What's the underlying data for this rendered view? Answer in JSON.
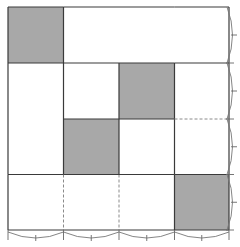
{
  "diagram": {
    "grid": {
      "rows": 4,
      "cols": 4
    },
    "colors": {
      "shaded": "#a8a8a8",
      "line": "#3a3a3a",
      "dashed": "#8a8a8a",
      "background": "#ffffff"
    },
    "shaded_cells": [
      {
        "row": 0,
        "col": 0
      },
      {
        "row": 1,
        "col": 2
      },
      {
        "row": 2,
        "col": 1
      },
      {
        "row": 3,
        "col": 3
      }
    ],
    "merged_regions": [
      {
        "row": 0,
        "col": 1,
        "rowspan": 1,
        "colspan": 3
      },
      {
        "row": 1,
        "col": 0,
        "rowspan": 2,
        "colspan": 1
      }
    ],
    "dashed_segments": [
      {
        "orientation": "vertical",
        "at_col_line": 1,
        "rows": [
          3,
          4
        ]
      },
      {
        "orientation": "vertical",
        "at_col_line": 2,
        "rows": [
          3,
          4
        ]
      },
      {
        "orientation": "horizontal",
        "at_row_line": 2,
        "cols": [
          3,
          4
        ]
      }
    ],
    "right_braces": 4,
    "bottom_braces": 4
  }
}
